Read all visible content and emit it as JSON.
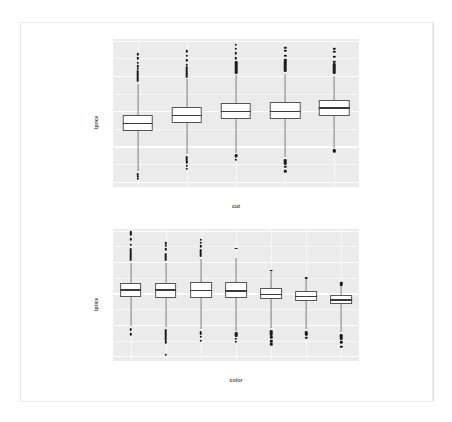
{
  "page": {
    "background": "#ffffff",
    "sheet_background": "#ffffff"
  },
  "style": {
    "panel_fill": "#ebebeb",
    "grid_color": "#ffffff",
    "box_fill": "#ffffff",
    "box_stroke": "#555555",
    "median_color": "#3a3a3a",
    "whisker_color": "#7a7a7a",
    "outlier_color": "#161616",
    "axis_text_color": "#7d7d7d"
  },
  "chart_data": [
    {
      "type": "box",
      "id": "boxplot-cut",
      "title": "",
      "xlabel": "cut",
      "ylabel": "lprice",
      "categories": [
        "Fair",
        "Good",
        "Very Good",
        "Premium",
        "Ideal"
      ],
      "ylim": [
        -2.15,
        2.05
      ],
      "yticks": [
        2,
        1,
        0,
        -1,
        -2
      ],
      "ytick_labels": [
        "2",
        "1",
        "0",
        "-1",
        "-2"
      ],
      "grid": true,
      "legend": "none",
      "boxes": [
        {
          "category": "Fair",
          "lower_whisker": -1.7,
          "q1": -0.57,
          "median": -0.35,
          "q3": -0.1,
          "upper_whisker": 0.78,
          "outliers_upper": [
            0.82,
            0.9,
            0.98,
            1.05,
            1.12,
            1.2,
            1.28,
            1.38,
            1.5,
            1.62
          ],
          "outliers_lower": [
            -1.75,
            -1.8,
            -1.86,
            -1.92
          ]
        },
        {
          "category": "Good",
          "lower_whisker": -1.22,
          "q1": -0.32,
          "median": -0.12,
          "q3": 0.13,
          "upper_whisker": 0.92,
          "outliers_upper": [
            0.95,
            1.02,
            1.1,
            1.2,
            1.32,
            1.45,
            1.58,
            1.7
          ],
          "outliers_lower": [
            -1.28,
            -1.36,
            -1.45,
            -1.55,
            -1.64
          ]
        },
        {
          "category": "Very Good",
          "lower_whisker": -1.18,
          "q1": -0.22,
          "median": -0.01,
          "q3": 0.24,
          "upper_whisker": 1.02,
          "outliers_upper": [
            1.06,
            1.14,
            1.24,
            1.36,
            1.5,
            1.64,
            1.78,
            1.88
          ],
          "outliers_lower": [
            -1.22,
            -1.3,
            -1.38
          ]
        },
        {
          "category": "Premium",
          "lower_whisker": -1.3,
          "q1": -0.22,
          "median": -0.01,
          "q3": 0.26,
          "upper_whisker": 1.05,
          "outliers_upper": [
            1.1,
            1.2,
            1.32,
            1.44,
            1.58,
            1.72,
            1.8
          ],
          "outliers_lower": [
            -1.36,
            -1.46,
            -1.58,
            -1.7
          ]
        },
        {
          "category": "Ideal",
          "lower_whisker": -1.05,
          "q1": -0.14,
          "median": 0.09,
          "q3": 0.33,
          "upper_whisker": 1.0,
          "outliers_upper": [
            1.05,
            1.14,
            1.26,
            1.4,
            1.55,
            1.68,
            1.78
          ],
          "outliers_lower": [
            -1.08,
            -1.14
          ]
        }
      ]
    },
    {
      "type": "box",
      "id": "boxplot-color",
      "title": "",
      "xlabel": "color",
      "ylabel": "lprice",
      "categories": [
        "D",
        "E",
        "F",
        "G",
        "H",
        "I",
        "J"
      ],
      "ylim": [
        -2.15,
        2.05
      ],
      "yticks": [
        2,
        1,
        0,
        -1,
        -2
      ],
      "ytick_labels": [
        "2",
        "1",
        "0",
        "-1",
        "-2"
      ],
      "grid": true,
      "legend": "none",
      "boxes": [
        {
          "category": "D",
          "lower_whisker": -1.05,
          "q1": -0.12,
          "median": 0.11,
          "q3": 0.33,
          "upper_whisker": 0.98,
          "outliers_upper": [
            1.02,
            1.12,
            1.24,
            1.38,
            1.55,
            1.72,
            1.88,
            1.95
          ],
          "outliers_lower": [
            -1.1,
            -1.18,
            -1.3
          ]
        },
        {
          "category": "E",
          "lower_whisker": -1.08,
          "q1": -0.13,
          "median": 0.1,
          "q3": 0.34,
          "upper_whisker": 0.98,
          "outliers_upper": [
            1.04,
            1.14,
            1.26,
            1.4,
            1.52,
            1.6
          ],
          "outliers_lower": [
            -1.14,
            -1.24,
            -1.34,
            -1.45,
            -1.55,
            -1.95
          ]
        },
        {
          "category": "F",
          "lower_whisker": -1.12,
          "q1": -0.14,
          "median": 0.09,
          "q3": 0.36,
          "upper_whisker": 1.1,
          "outliers_upper": [
            1.16,
            1.26,
            1.38,
            1.5,
            1.62,
            1.7
          ],
          "outliers_lower": [
            -1.18,
            -1.28,
            -1.38,
            -1.5
          ]
        },
        {
          "category": "G",
          "lower_whisker": -1.18,
          "q1": -0.15,
          "median": 0.08,
          "q3": 0.36,
          "upper_whisker": 1.12,
          "outliers_upper": [
            1.45
          ],
          "outliers_lower": [
            -1.24,
            -1.34,
            -1.44,
            -1.54
          ]
        },
        {
          "category": "H",
          "lower_whisker": -1.1,
          "q1": -0.18,
          "median": -0.03,
          "q3": 0.18,
          "upper_whisker": 0.72,
          "outliers_upper": [
            0.76
          ],
          "outliers_lower": [
            -1.16,
            -1.28,
            -1.4,
            -1.52,
            -1.62
          ]
        },
        {
          "category": "I",
          "lower_whisker": -1.12,
          "q1": -0.24,
          "median": -0.1,
          "q3": 0.08,
          "upper_whisker": 0.48,
          "outliers_upper": [
            0.52
          ],
          "outliers_lower": [
            -1.18,
            -1.3,
            -1.42
          ]
        },
        {
          "category": "J",
          "lower_whisker": -1.22,
          "q1": -0.34,
          "median": -0.2,
          "q3": -0.04,
          "upper_whisker": 0.24,
          "outliers_upper": [
            0.28,
            0.32
          ],
          "outliers_lower": [
            -1.3,
            -1.42,
            -1.56,
            -1.7
          ]
        }
      ]
    }
  ]
}
